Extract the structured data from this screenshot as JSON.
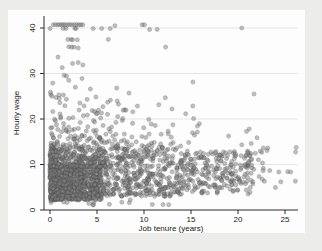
{
  "page": {
    "background_color": "#ececea",
    "figure_background_color": "#fdfdfd"
  },
  "chart_data": {
    "type": "scatter",
    "title": "",
    "xlabel": "Job tenure (years)",
    "ylabel": "Hourly wage",
    "xlim": [
      -0.64,
      26.4
    ],
    "ylim": [
      0,
      42.6
    ],
    "x_ticks": [
      0,
      5,
      10,
      15,
      20,
      25
    ],
    "y_ticks": [
      0,
      10,
      20,
      30,
      40
    ],
    "grid": {
      "horizontal_at": [
        10,
        20,
        30,
        40
      ],
      "vertical": false,
      "color": "#e3e5e7"
    },
    "legend": "none",
    "axis_color": "#2a2a2a",
    "tick_label_style": {
      "y_labels_rotated_90": true,
      "font_px": 8
    },
    "marker": {
      "shape": "circle",
      "radius_px": 2,
      "fill": "#828282",
      "stroke": "#4f4f4f",
      "opacity": 0.5
    },
    "n_points_estimate": 2100,
    "notable_points": [
      [
        0.35,
        40.7
      ],
      [
        0.6,
        40.75
      ],
      [
        0.85,
        40.7
      ],
      [
        1.05,
        40.75
      ],
      [
        1.25,
        40.7
      ],
      [
        1.45,
        40.75
      ],
      [
        1.65,
        40.7
      ],
      [
        1.9,
        40.7
      ],
      [
        2.1,
        40.75
      ],
      [
        2.35,
        40.7
      ],
      [
        2.6,
        40.7
      ],
      [
        2.85,
        40.75
      ],
      [
        3.1,
        40.7
      ],
      [
        3.3,
        40.7
      ],
      [
        3.5,
        40.7
      ],
      [
        6.9,
        40.5
      ],
      [
        9.8,
        40.7
      ],
      [
        10.05,
        40.7
      ],
      [
        20.4,
        40.0
      ],
      [
        0.0,
        39.9
      ],
      [
        1.4,
        39.9
      ],
      [
        1.7,
        39.9
      ],
      [
        2.65,
        39.9
      ],
      [
        2.78,
        39.9
      ],
      [
        4.6,
        39.9
      ],
      [
        5.5,
        39.9
      ],
      [
        6.4,
        39.9
      ],
      [
        10.6,
        39.7
      ],
      [
        11.4,
        39.7
      ],
      [
        1.9,
        37.5
      ],
      [
        2.25,
        37.5
      ],
      [
        2.4,
        37.4
      ],
      [
        2.9,
        37.4
      ],
      [
        6.2,
        37.5
      ],
      [
        2.0,
        35.9
      ],
      [
        2.3,
        35.8
      ],
      [
        2.55,
        35.8
      ],
      [
        3.0,
        35.6
      ],
      [
        12.3,
        35.8
      ],
      [
        0.85,
        33.6
      ],
      [
        2.4,
        32.2
      ],
      [
        3.0,
        32.4
      ],
      [
        3.5,
        31.9
      ],
      [
        1.3,
        31.3
      ],
      [
        1.5,
        29.6
      ],
      [
        1.75,
        29.4
      ],
      [
        2.0,
        28.5
      ],
      [
        3.4,
        28.9
      ],
      [
        15.2,
        28.1
      ],
      [
        0.3,
        27.9
      ],
      [
        0.05,
        25.9
      ],
      [
        0.95,
        25.3
      ],
      [
        2.7,
        27.0
      ],
      [
        4.3,
        26.6
      ],
      [
        7.1,
        26.8
      ],
      [
        8.4,
        25.7
      ],
      [
        21.7,
        25.5
      ]
    ],
    "density_clusters": [
      {
        "label": "dense-core-low-wage",
        "n": 850,
        "t": [
          0,
          5.5
        ],
        "w": [
          2.2,
          9.5
        ],
        "tskew": 1.3,
        "wskew": 1.15
      },
      {
        "label": "dense-core-mid-wage",
        "n": 300,
        "t": [
          0,
          5.5
        ],
        "w": [
          9.5,
          14
        ],
        "tskew": 1.3,
        "wskew": 1.6
      },
      {
        "label": "mid-tenure-spread",
        "n": 430,
        "t": [
          5.5,
          14
        ],
        "w": [
          3,
          14
        ],
        "tskew": 1.15,
        "wskew": 1.2
      },
      {
        "label": "right-band",
        "n": 240,
        "t": [
          14,
          21.8
        ],
        "w": [
          3.5,
          13
        ],
        "tskew": 1.05,
        "wskew": 1.0
      },
      {
        "label": "far-right-sparse",
        "n": 22,
        "t": [
          21.8,
          26.2
        ],
        "w": [
          3.8,
          13.8
        ],
        "tskew": 1.0,
        "wskew": 1.0
      },
      {
        "label": "band-14-20-left",
        "n": 95,
        "t": [
          0,
          9
        ],
        "w": [
          14,
          20
        ],
        "tskew": 1.3,
        "wskew": 1.4
      },
      {
        "label": "band-14-20-mid",
        "n": 28,
        "t": [
          9,
          16
        ],
        "w": [
          14,
          20
        ],
        "tskew": 1.0,
        "wskew": 1.3
      },
      {
        "label": "band-14-20-right",
        "n": 6,
        "t": [
          16,
          23
        ],
        "w": [
          14,
          19
        ],
        "tskew": 1.0,
        "wskew": 1.0
      },
      {
        "label": "upper-20-26-left",
        "n": 38,
        "t": [
          0,
          8
        ],
        "w": [
          20,
          25.5
        ],
        "tskew": 1.3,
        "wskew": 1.5
      },
      {
        "label": "upper-20-25-mid",
        "n": 9,
        "t": [
          8,
          16
        ],
        "w": [
          20,
          25
        ],
        "tskew": 1.0,
        "wskew": 1.3
      },
      {
        "label": "very-low-wage-fringe",
        "n": 16,
        "t": [
          0,
          13
        ],
        "w": [
          1.1,
          2.3
        ],
        "tskew": 1.5,
        "wskew": 1.0
      }
    ]
  },
  "layout_px": {
    "canvas": [
      322,
      251
    ],
    "plot_box": {
      "left": 44,
      "top": 16,
      "right": 298,
      "bottom": 210
    },
    "x_scale": {
      "t0_px": 50,
      "px_per_unit": 9.4
    },
    "y_scale": {
      "w0_px": 210,
      "px_per_unit": 4.55
    }
  }
}
